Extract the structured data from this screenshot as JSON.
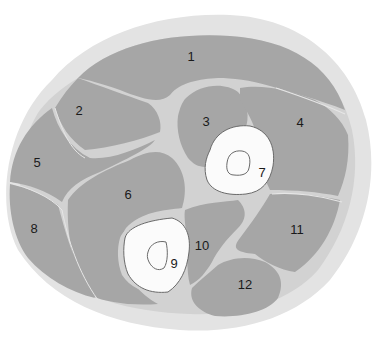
{
  "diagram": {
    "type": "anatomical cross-section",
    "colors": {
      "background": "#ffffff",
      "skin": "#e3e3e3",
      "fascia": "#d2d2d2",
      "muscle": "#a6a6a6",
      "bone": "#fbfbfb",
      "bone_outline": "#6a6a6a",
      "septum_line": "#e6e6e6",
      "label": "#1a1a1a"
    },
    "labels": [
      {
        "id": "1",
        "text": "1",
        "x": 191,
        "y": 61
      },
      {
        "id": "2",
        "text": "2",
        "x": 79,
        "y": 115
      },
      {
        "id": "3",
        "text": "3",
        "x": 206,
        "y": 126
      },
      {
        "id": "4",
        "text": "4",
        "x": 300,
        "y": 127
      },
      {
        "id": "5",
        "text": "5",
        "x": 37,
        "y": 167
      },
      {
        "id": "6",
        "text": "6",
        "x": 128,
        "y": 199
      },
      {
        "id": "7",
        "text": "7",
        "x": 262,
        "y": 177
      },
      {
        "id": "8",
        "text": "8",
        "x": 34,
        "y": 233
      },
      {
        "id": "9",
        "text": "9",
        "x": 174,
        "y": 268
      },
      {
        "id": "10",
        "text": "10",
        "x": 202,
        "y": 250
      },
      {
        "id": "11",
        "text": "11",
        "x": 297,
        "y": 234
      },
      {
        "id": "12",
        "text": "12",
        "x": 245,
        "y": 289
      }
    ]
  }
}
